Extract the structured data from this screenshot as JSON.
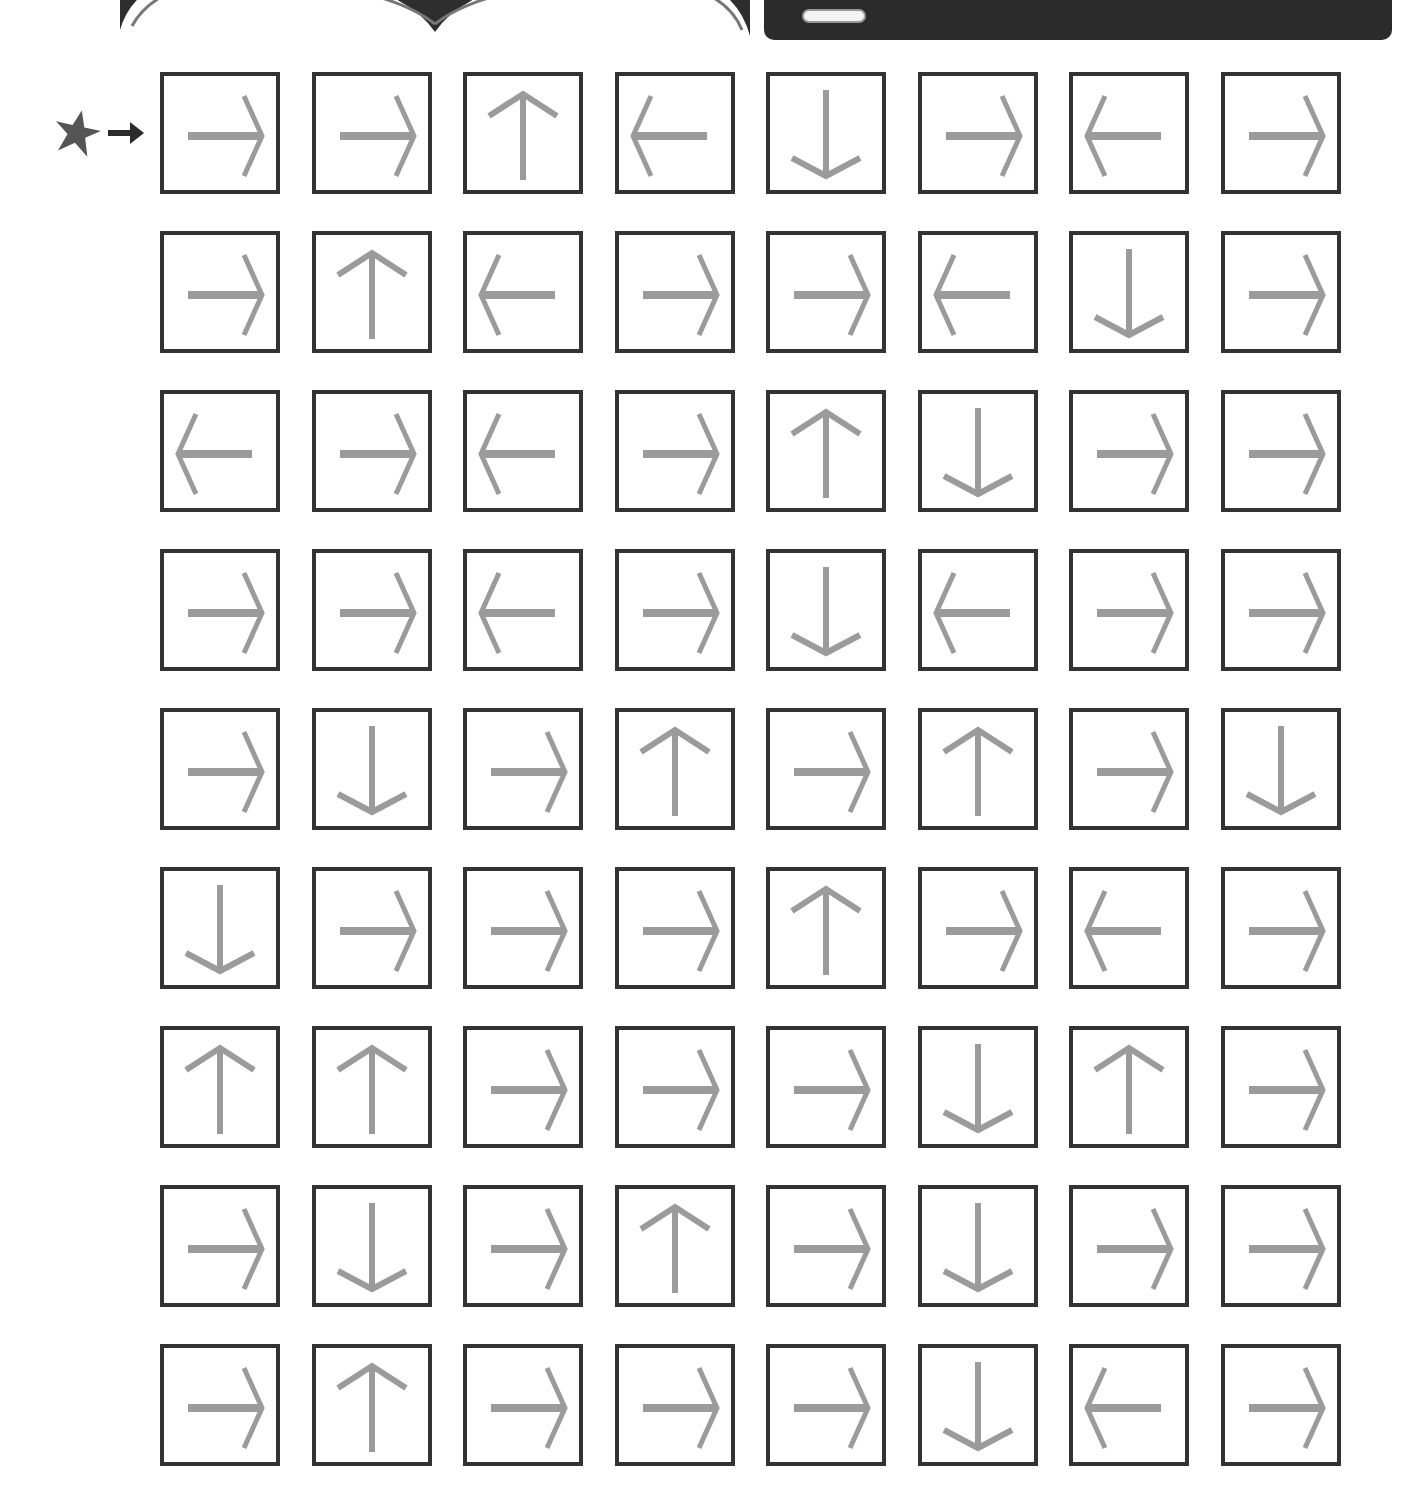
{
  "worksheet": {
    "start_marker": {
      "icon": "star-icon",
      "pointer": "arrow-right-icon",
      "color": "#555555"
    },
    "colors": {
      "box_border": "#333333",
      "arrow": "#9b9b9b",
      "band": "#dcdcdc",
      "banner": "#2b2b2b"
    },
    "grid": {
      "rows": 9,
      "cols": 8,
      "arrows": [
        [
          "right",
          "right",
          "up",
          "left",
          "down",
          "right",
          "left",
          "right"
        ],
        [
          "right",
          "up",
          "left",
          "right",
          "right",
          "left",
          "down",
          "right"
        ],
        [
          "left",
          "right",
          "left",
          "right",
          "up",
          "down",
          "right",
          "right"
        ],
        [
          "right",
          "right",
          "left",
          "right",
          "down",
          "left",
          "right",
          "right"
        ],
        [
          "right",
          "down",
          "right",
          "up",
          "right",
          "up",
          "right",
          "down"
        ],
        [
          "down",
          "right",
          "right",
          "right",
          "up",
          "right",
          "left",
          "right"
        ],
        [
          "up",
          "up",
          "right",
          "right",
          "right",
          "down",
          "up",
          "right"
        ],
        [
          "right",
          "down",
          "right",
          "up",
          "right",
          "down",
          "right",
          "right"
        ],
        [
          "right",
          "up",
          "right",
          "right",
          "right",
          "down",
          "left",
          "right"
        ]
      ]
    }
  }
}
